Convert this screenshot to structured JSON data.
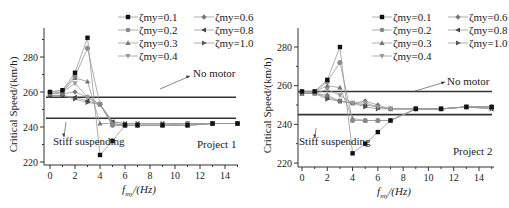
{
  "chart_data": [
    {
      "type": "line",
      "title": "Project 1",
      "xlabel": "f_my/(Hz)",
      "ylabel": "Critical Speed/(km/h)",
      "xlim": [
        -0.5,
        15.5
      ],
      "ylim": [
        218,
        298
      ],
      "xticks": [
        0,
        2,
        4,
        6,
        8,
        10,
        12,
        14
      ],
      "yticks": [
        220,
        240,
        260,
        280
      ],
      "grid": false,
      "legend_position": "top-right",
      "x": [
        0,
        1,
        2,
        3,
        4,
        5,
        6,
        7,
        9,
        11,
        13,
        15
      ],
      "series": [
        {
          "name": "ζmy=0.1",
          "marker": "square",
          "color": "#111111",
          "values": [
            260,
            261,
            271,
            291,
            224,
            232,
            241,
            241,
            241,
            241,
            242,
            242
          ]
        },
        {
          "name": "ζmy=0.2",
          "marker": "circle",
          "color": "#888888",
          "values": [
            260,
            261,
            269,
            285,
            253,
            241,
            241,
            241,
            241,
            241,
            242,
            242
          ]
        },
        {
          "name": "ζmy=0.3",
          "marker": "triangle-up",
          "color": "#777777",
          "values": [
            259,
            260,
            268,
            266,
            242,
            242,
            241,
            241,
            241,
            241,
            242,
            242
          ]
        },
        {
          "name": "ζmy=0.4",
          "marker": "triangle-down",
          "color": "#999999",
          "values": [
            259,
            260,
            265,
            257,
            253,
            241,
            241,
            241,
            241,
            241,
            242,
            242
          ]
        },
        {
          "name": "ζmy=0.6",
          "marker": "diamond",
          "color": "#777777",
          "values": [
            259,
            259,
            260,
            257,
            253,
            242,
            241,
            241,
            241,
            242,
            242,
            242
          ]
        },
        {
          "name": "ζmy=0.8",
          "marker": "triangle-left",
          "color": "#444444",
          "values": [
            258,
            258,
            257,
            255,
            253,
            243,
            242,
            242,
            242,
            242,
            242,
            242
          ]
        },
        {
          "name": "ζmy=1.0",
          "marker": "triangle-right",
          "color": "#555555",
          "values": [
            258,
            258,
            256,
            254,
            253,
            243,
            242,
            242,
            242,
            242,
            242,
            242
          ]
        }
      ],
      "reference_lines": [
        {
          "label": "No motor",
          "y": 257
        },
        {
          "label": "Stiff suspending",
          "y": 245
        }
      ],
      "annotations": [
        "No motor",
        "Stiff suspending",
        "Project 1"
      ]
    },
    {
      "type": "line",
      "title": "Project 2",
      "xlabel": "f_my/(Hz)",
      "ylabel": "Critical Speed/(km/h)",
      "xlim": [
        -0.5,
        15.5
      ],
      "ylim": [
        218,
        290
      ],
      "xticks": [
        0,
        2,
        4,
        6,
        8,
        10,
        12,
        14
      ],
      "yticks": [
        220,
        240,
        260,
        280
      ],
      "grid": false,
      "legend_position": "top-right",
      "x": [
        0,
        1,
        2,
        3,
        4,
        5,
        6,
        7,
        9,
        11,
        13,
        15
      ],
      "series": [
        {
          "name": "ζmy=0.1",
          "marker": "square",
          "color": "#111111",
          "values": [
            257,
            257,
            263,
            280,
            225,
            230,
            236,
            242,
            248,
            248,
            249,
            249
          ]
        },
        {
          "name": "ζmy=0.2",
          "marker": "circle",
          "color": "#888888",
          "values": [
            257,
            257,
            262,
            272,
            242,
            242,
            242,
            242,
            248,
            248,
            249,
            249
          ]
        },
        {
          "name": "ζmy=0.3",
          "marker": "triangle-up",
          "color": "#777777",
          "values": [
            256,
            257,
            260,
            259,
            243,
            242,
            242,
            242,
            248,
            248,
            249,
            249
          ]
        },
        {
          "name": "ζmy=0.4",
          "marker": "triangle-down",
          "color": "#999999",
          "values": [
            256,
            256,
            258,
            255,
            251,
            251,
            249,
            248,
            248,
            248,
            249,
            249
          ]
        },
        {
          "name": "ζmy=0.6",
          "marker": "diamond",
          "color": "#777777",
          "values": [
            256,
            256,
            255,
            252,
            251,
            252,
            250,
            248,
            248,
            248,
            249,
            249
          ]
        },
        {
          "name": "ζmy=0.8",
          "marker": "triangle-left",
          "color": "#444444",
          "values": [
            256,
            256,
            254,
            252,
            251,
            250,
            249,
            248,
            248,
            248,
            249,
            248
          ]
        },
        {
          "name": "ζmy=1.0",
          "marker": "triangle-right",
          "color": "#555555",
          "values": [
            256,
            256,
            253,
            252,
            251,
            249,
            248,
            248,
            248,
            248,
            249,
            248
          ]
        }
      ],
      "reference_lines": [
        {
          "label": "No motor",
          "y": 257
        },
        {
          "label": "Stiff suspending",
          "y": 245
        }
      ],
      "annotations": [
        "No motor",
        "Stiff suspending",
        "Project 2"
      ]
    }
  ],
  "labels": {
    "ylabel": "Critical Speed/(km/h)",
    "xlabel_main": "f",
    "xlabel_sub": "my",
    "xlabel_unit": "/(Hz)",
    "no_motor": "No motor",
    "stiff": "Stiff suspending",
    "project1": "Project 1",
    "project2": "Project 2"
  }
}
